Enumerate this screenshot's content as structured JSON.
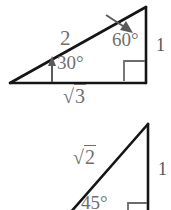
{
  "figure": {
    "background_color": "#ffffff",
    "stroke_color": "#1a1a1a",
    "label_color": "#6f6f6f",
    "triangles": [
      {
        "id": "triangle-30-60-90",
        "type": "30-60-90",
        "vertices": {
          "left": [
            10,
            83
          ],
          "right_angle": [
            146,
            83
          ],
          "apex": [
            146,
            7
          ]
        },
        "angles": [
          {
            "name": "angle-30",
            "label": "30°",
            "at": "left",
            "marker": "arrow-up"
          },
          {
            "name": "angle-60",
            "label": "60°",
            "at": "apex",
            "marker": "arrow-down-right"
          },
          {
            "name": "angle-90",
            "label": "",
            "at": "right_angle",
            "marker": "square"
          }
        ],
        "sides": [
          {
            "name": "hypotenuse",
            "label": "2"
          },
          {
            "name": "base",
            "label": "√3",
            "radicand": "3"
          },
          {
            "name": "vertical",
            "label": "1"
          }
        ]
      },
      {
        "id": "triangle-45-45-90",
        "type": "45-45-90",
        "vertices": {
          "left": [
            74,
            210
          ],
          "right_angle": [
            148,
            210
          ],
          "apex": [
            148,
            124
          ]
        },
        "angles": [
          {
            "name": "angle-45",
            "label": "45°",
            "at": "left",
            "marker": "none"
          },
          {
            "name": "angle-90",
            "label": "",
            "at": "right_angle",
            "marker": "square"
          }
        ],
        "sides": [
          {
            "name": "hypotenuse",
            "label": "√2",
            "radicand": "2"
          },
          {
            "name": "vertical",
            "label": "1"
          }
        ]
      }
    ],
    "labels": {
      "top_hypotenuse": "2",
      "top_angle_30": "30°",
      "top_angle_60": "60°",
      "top_base_radicand": "3",
      "top_vertical": "1",
      "bottom_hypotenuse_radicand": "2",
      "bottom_angle_45": "45°",
      "bottom_vertical": "1"
    }
  }
}
